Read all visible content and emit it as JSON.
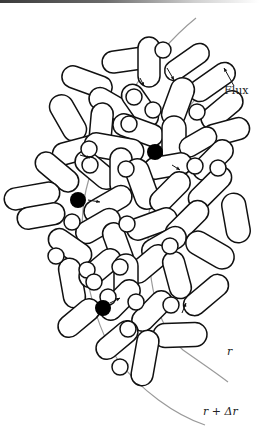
{
  "figure": {
    "labels": {
      "flux": "Flux",
      "r_inner": "r",
      "r_outer": "r + Δr"
    },
    "colors": {
      "stroke": "#111111",
      "fill": "#ffffff",
      "curve": "#9a9a9a",
      "dot": "#000000"
    },
    "capsules": [
      [
        128,
        60,
        26,
        11,
        -8
      ],
      [
        87,
        82,
        26,
        11,
        20
      ],
      [
        149,
        62,
        11,
        25,
        0
      ],
      [
        187,
        62,
        25,
        10,
        -35
      ],
      [
        212,
        82,
        26,
        11,
        -35
      ],
      [
        113,
        106,
        26,
        11,
        30
      ],
      [
        140,
        106,
        24,
        11,
        55
      ],
      [
        178,
        102,
        12,
        25,
        20
      ],
      [
        222,
        110,
        24,
        11,
        -40
      ],
      [
        68,
        118,
        12,
        25,
        -30
      ],
      [
        101,
        128,
        11,
        25,
        5
      ],
      [
        138,
        130,
        26,
        11,
        20
      ],
      [
        174,
        140,
        12,
        24,
        0
      ],
      [
        226,
        132,
        24,
        11,
        -15
      ],
      [
        78,
        150,
        26,
        11,
        -15
      ],
      [
        114,
        148,
        30,
        12,
        10
      ],
      [
        198,
        142,
        20,
        10,
        -30
      ],
      [
        213,
        160,
        24,
        11,
        -45
      ],
      [
        57,
        172,
        25,
        11,
        40
      ],
      [
        96,
        170,
        24,
        11,
        40
      ],
      [
        121,
        172,
        11,
        24,
        0
      ],
      [
        168,
        166,
        24,
        11,
        -10
      ],
      [
        32,
        196,
        28,
        11,
        -10
      ],
      [
        108,
        204,
        26,
        11,
        -30
      ],
      [
        142,
        184,
        12,
        26,
        -20
      ],
      [
        170,
        192,
        24,
        11,
        -45
      ],
      [
        210,
        188,
        26,
        11,
        -45
      ],
      [
        41,
        216,
        24,
        11,
        -10
      ],
      [
        98,
        226,
        24,
        11,
        -30
      ],
      [
        152,
        224,
        26,
        11,
        -20
      ],
      [
        187,
        222,
        26,
        11,
        -45
      ],
      [
        236,
        218,
        12,
        25,
        -10
      ],
      [
        70,
        247,
        24,
        11,
        35
      ],
      [
        118,
        246,
        11,
        24,
        -20
      ],
      [
        164,
        244,
        24,
        11,
        -30
      ],
      [
        210,
        250,
        26,
        12,
        30
      ],
      [
        72,
        283,
        11,
        25,
        -10
      ],
      [
        100,
        268,
        24,
        11,
        -40
      ],
      [
        148,
        264,
        24,
        11,
        -40
      ],
      [
        126,
        280,
        12,
        26,
        0
      ],
      [
        177,
        275,
        11,
        24,
        -15
      ],
      [
        206,
        295,
        26,
        11,
        -40
      ],
      [
        120,
        300,
        24,
        11,
        -45
      ],
      [
        152,
        311,
        24,
        11,
        -45
      ],
      [
        79,
        318,
        24,
        11,
        -40
      ],
      [
        117,
        340,
        24,
        11,
        -40
      ],
      [
        180,
        335,
        27,
        12,
        -2
      ],
      [
        145,
        358,
        11,
        28,
        10
      ]
    ],
    "circles": [
      [
        163,
        50,
        8
      ],
      [
        134,
        97,
        8
      ],
      [
        153,
        110,
        8
      ],
      [
        197,
        112,
        8
      ],
      [
        89,
        149,
        8
      ],
      [
        129,
        124,
        8
      ],
      [
        195,
        166,
        8
      ],
      [
        90,
        165,
        8
      ],
      [
        126,
        169,
        8
      ],
      [
        218,
        168,
        8
      ],
      [
        72,
        222,
        8
      ],
      [
        127,
        224,
        8
      ],
      [
        170,
        246,
        8
      ],
      [
        56,
        256,
        8
      ],
      [
        87,
        270,
        8
      ],
      [
        120,
        267,
        8
      ],
      [
        94,
        282,
        8
      ],
      [
        108,
        297,
        8
      ],
      [
        136,
        302,
        8
      ],
      [
        171,
        305,
        8
      ],
      [
        128,
        329,
        8
      ],
      [
        120,
        367,
        8
      ]
    ],
    "dots": [
      [
        155,
        152,
        8
      ],
      [
        78,
        200,
        8
      ],
      [
        103,
        308,
        8
      ]
    ],
    "arrows": [
      [
        167,
        68,
        174,
        80
      ],
      [
        172,
        165,
        180,
        170
      ],
      [
        88,
        200,
        100,
        202
      ],
      [
        110,
        303,
        120,
        298
      ],
      [
        80,
        155,
        90,
        158
      ],
      [
        182,
        313,
        186,
        303
      ],
      [
        140,
        78,
        144,
        86
      ]
    ],
    "curves": {
      "outer": "M196,18 C150,55 100,130 86,190 C75,240 90,320 118,360 C140,390 175,415 205,425",
      "inner": "M218,80 C180,105 150,160 148,230 C148,290 160,330 183,350 C200,362 215,372 228,382"
    },
    "flux_arrow": [
      234,
      86,
      224,
      68
    ]
  }
}
